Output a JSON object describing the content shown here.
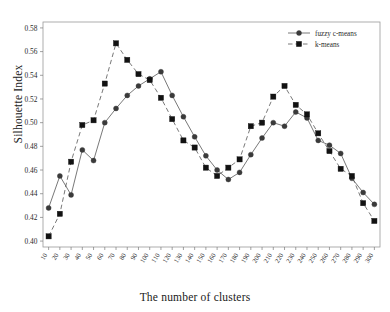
{
  "chart_data": {
    "type": "line",
    "title": "",
    "xlabel": "The number of clusters",
    "ylabel": "Silhouette Index",
    "grid": false,
    "legend_position": "top-right",
    "xlim": [
      5,
      305
    ],
    "ylim": [
      0.395,
      0.585
    ],
    "yticks": [
      "0.40",
      "0.42",
      "0.44",
      "0.46",
      "0.48",
      "0.50",
      "0.52",
      "0.54",
      "0.56",
      "0.58"
    ],
    "ytick_values": [
      0.4,
      0.42,
      0.44,
      0.46,
      0.48,
      0.5,
      0.52,
      0.54,
      0.56,
      0.58
    ],
    "categories": [
      10,
      20,
      30,
      40,
      50,
      60,
      70,
      80,
      90,
      100,
      110,
      120,
      130,
      140,
      150,
      160,
      170,
      180,
      190,
      200,
      210,
      220,
      230,
      240,
      250,
      260,
      270,
      280,
      290,
      300
    ],
    "xtick_labels": [
      "10",
      "20",
      "30",
      "40",
      "50",
      "60",
      "70",
      "80",
      "90",
      "100",
      "110",
      "120",
      "130",
      "140",
      "150",
      "160",
      "170",
      "180",
      "190",
      "200",
      "210",
      "220",
      "230",
      "240",
      "250",
      "260",
      "270",
      "280",
      "290",
      "300"
    ],
    "series": [
      {
        "name": "fuzzy c-means",
        "marker": "circle",
        "linestyle": "solid",
        "color": "#3a3a3a",
        "values": [
          0.428,
          0.455,
          0.439,
          0.477,
          0.468,
          0.5,
          0.512,
          0.523,
          0.531,
          0.537,
          0.543,
          0.523,
          0.505,
          0.488,
          0.472,
          0.46,
          0.452,
          0.458,
          0.473,
          0.487,
          0.5,
          0.497,
          0.509,
          0.504,
          0.485,
          0.481,
          0.474,
          0.453,
          0.441,
          0.431
        ]
      },
      {
        "name": "k-means",
        "marker": "square",
        "linestyle": "dashed",
        "color": "#121212",
        "values": [
          0.404,
          0.423,
          0.467,
          0.498,
          0.502,
          0.533,
          0.567,
          0.553,
          0.541,
          0.536,
          0.521,
          0.503,
          0.485,
          0.479,
          0.462,
          0.455,
          0.462,
          0.469,
          0.497,
          0.5,
          0.522,
          0.531,
          0.515,
          0.507,
          0.491,
          0.476,
          0.461,
          0.455,
          0.432,
          0.417
        ]
      }
    ]
  },
  "legend": {
    "entries": [
      {
        "label": "fuzzy c-means"
      },
      {
        "label": "k-means"
      }
    ]
  }
}
